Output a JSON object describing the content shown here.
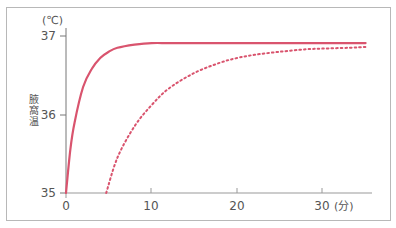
{
  "chart_data": {
    "type": "line",
    "title": "",
    "xlabel": "(分)",
    "ylabel": "腋窩温",
    "y_unit": "(℃)",
    "xlim": [
      0,
      35
    ],
    "ylim": [
      35,
      37
    ],
    "x_ticks": [
      "0",
      "10",
      "20",
      "30"
    ],
    "y_ticks": [
      "35",
      "36",
      "37"
    ],
    "grid": false,
    "legend": null,
    "series": [
      {
        "name": "solid",
        "style": "solid",
        "color": "#d9546e",
        "x": [
          0,
          0.5,
          1,
          2,
          3,
          4,
          5,
          6,
          8,
          10,
          12,
          15,
          20,
          25,
          30,
          35
        ],
        "y": [
          35.0,
          35.55,
          35.9,
          36.35,
          36.58,
          36.72,
          36.8,
          36.85,
          36.89,
          36.91,
          36.91,
          36.91,
          36.91,
          36.91,
          36.91,
          36.91
        ]
      },
      {
        "name": "dotted",
        "style": "dotted",
        "color": "#d9546e",
        "x": [
          4.7,
          6,
          8,
          10,
          12,
          15,
          18,
          20,
          22,
          25,
          28,
          30,
          33,
          35
        ],
        "y": [
          35.0,
          35.45,
          35.85,
          36.12,
          36.33,
          36.53,
          36.66,
          36.72,
          36.76,
          36.8,
          36.83,
          36.84,
          36.85,
          36.86
        ]
      }
    ]
  },
  "labels": {
    "y_unit": "(℃)",
    "y_title_chars": [
      "腋",
      "窩",
      "温"
    ],
    "y_ticks": [
      "37",
      "36",
      "35"
    ],
    "x_ticks": [
      "0",
      "10",
      "20",
      "30"
    ],
    "x_unit": "(分)"
  }
}
